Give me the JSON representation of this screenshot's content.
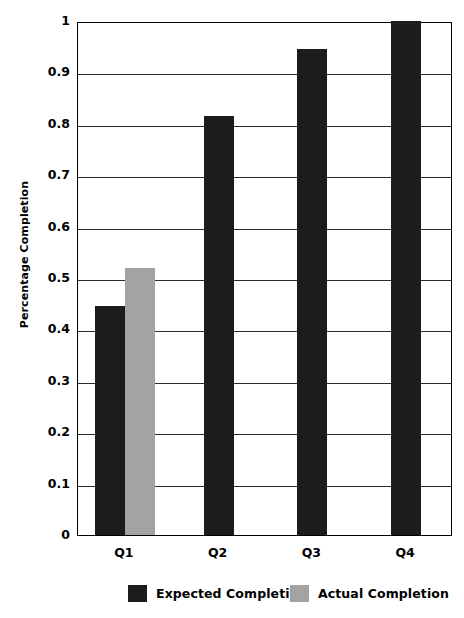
{
  "chart_data": {
    "type": "bar",
    "title": "",
    "xlabel": "",
    "ylabel": "Percentage Completion",
    "categories": [
      "Q1",
      "Q2",
      "Q3",
      "Q4"
    ],
    "series": [
      {
        "name": "Expected Completion",
        "color": "#1c1c1c",
        "values": [
          0.445,
          0.815,
          0.945,
          1.0
        ]
      },
      {
        "name": "Actual Completion",
        "color": "#a3a3a3",
        "values": [
          0.52,
          null,
          null,
          null
        ]
      }
    ],
    "ylim": [
      0,
      1
    ],
    "ytick_labels": [
      "0",
      "0.1",
      "0.2",
      "0.3",
      "0.4",
      "0.5",
      "0.6",
      "0.7",
      "0.8",
      "0.9",
      "1"
    ],
    "ytick_values": [
      0,
      0.1,
      0.2,
      0.3,
      0.4,
      0.5,
      0.6,
      0.7,
      0.8,
      0.9,
      1
    ],
    "grid": true,
    "legend_position": "bottom",
    "legend_entries": [
      {
        "label": "Expected Completion",
        "color": "#1c1c1c"
      },
      {
        "label": "Actual Completion",
        "color": "#a3a3a3"
      }
    ]
  }
}
